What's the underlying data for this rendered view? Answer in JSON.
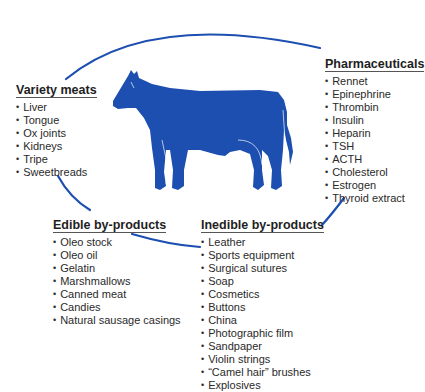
{
  "colors": {
    "accent": "#1c4fb0",
    "text": "#2a2a2a"
  },
  "center_image": "cow-silhouette",
  "groups": {
    "variety": {
      "title": "Variety meats",
      "items": [
        "Liver",
        "Tongue",
        "Ox joints",
        "Kidneys",
        "Tripe",
        "Sweetbreads"
      ]
    },
    "pharma": {
      "title": "Pharmaceuticals",
      "items": [
        "Rennet",
        "Epinephrine",
        "Thrombin",
        "Insulin",
        "Heparin",
        "TSH",
        "ACTH",
        "Cholesterol",
        "Estrogen",
        "Thyroid extract"
      ]
    },
    "edible": {
      "title": "Edible by-products",
      "items": [
        "Oleo stock",
        "Oleo oil",
        "Gelatin",
        "Marshmallows",
        "Canned meat",
        "Candies",
        "Natural sausage casings"
      ]
    },
    "inedible": {
      "title": "Inedible by-products",
      "items": [
        "Leather",
        "Sports equipment",
        "Surgical sutures",
        "Soap",
        "Cosmetics",
        "Buttons",
        "China",
        "Photographic film",
        "Sandpaper",
        "Violin strings",
        "“Camel hair” brushes",
        "Explosives"
      ]
    }
  }
}
